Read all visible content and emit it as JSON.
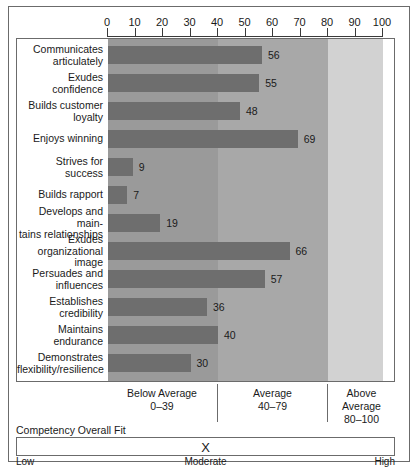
{
  "chart_data": {
    "type": "bar",
    "orientation": "horizontal",
    "title": "",
    "xlabel": "",
    "ylabel": "",
    "xlim": [
      0,
      100
    ],
    "grid": false,
    "legend_position": "below-axis",
    "categories": [
      "Communicates articulately",
      "Exudes confidence",
      "Builds customer loyalty",
      "Enjoys winning",
      "Strives for success",
      "Builds rapport",
      "Develops and main-tains relationships",
      "Exudes organizational image",
      "Persuades and influences",
      "Establishes credibility",
      "Maintains endurance",
      "Demonstrates flexibility/resilience"
    ],
    "values": [
      56,
      55,
      48,
      69,
      9,
      7,
      19,
      66,
      57,
      36,
      40,
      30
    ],
    "tick_values": [
      0,
      10,
      20,
      30,
      40,
      50,
      60,
      70,
      80,
      90,
      100
    ],
    "tick_labels": [
      "0",
      "10",
      "20",
      "30",
      "40",
      "50",
      "60",
      "70",
      "80",
      "90",
      "100"
    ],
    "bands": [
      {
        "name": "Below Average",
        "range_label": "0–39",
        "min": 0,
        "max": 40,
        "color": "#9a9a9a"
      },
      {
        "name": "Average",
        "range_label": "40–79",
        "min": 40,
        "max": 80,
        "color": "#a8a8a8"
      },
      {
        "name": "Above Average",
        "range_label": "80–100",
        "min": 80,
        "max": 100,
        "color": "#d2d2d2"
      }
    ],
    "bar_color": "#6e6e6e"
  },
  "rows": [
    {
      "label_line1": "Communicates",
      "label_line2": "articulately",
      "value": 56
    },
    {
      "label_line1": "Exudes confidence",
      "label_line2": "",
      "value": 55
    },
    {
      "label_line1": "Builds customer",
      "label_line2": "loyalty",
      "value": 48
    },
    {
      "label_line1": "Enjoys winning",
      "label_line2": "",
      "value": 69
    },
    {
      "label_line1": "Strives for success",
      "label_line2": "",
      "value": 9
    },
    {
      "label_line1": "Builds rapport",
      "label_line2": "",
      "value": 7
    },
    {
      "label_line1": "Develops and main-",
      "label_line2": "tains relationships",
      "value": 19
    },
    {
      "label_line1": "Exudes organizational",
      "label_line2": "image",
      "value": 66
    },
    {
      "label_line1": "Persuades and",
      "label_line2": "influences",
      "value": 57
    },
    {
      "label_line1": "Establishes credibility",
      "label_line2": "",
      "value": 36
    },
    {
      "label_line1": "Maintains endurance",
      "label_line2": "",
      "value": 40
    },
    {
      "label_line1": "Demonstrates",
      "label_line2": "flexibility/resilience",
      "value": 30
    }
  ],
  "axis": {
    "ticks": [
      "0",
      "10",
      "20",
      "30",
      "40",
      "50",
      "60",
      "70",
      "80",
      "90",
      "100"
    ]
  },
  "legend": {
    "below": {
      "name": "Below Average",
      "range": "0–39"
    },
    "average": {
      "name": "Average",
      "range": "40–79"
    },
    "above": {
      "name": "Above Average",
      "range": "80–100"
    }
  },
  "overall_fit": {
    "title": "Competency Overall Fit",
    "marker": "X",
    "scale_low": "Low",
    "scale_mid": "Moderate",
    "scale_high": "High"
  }
}
